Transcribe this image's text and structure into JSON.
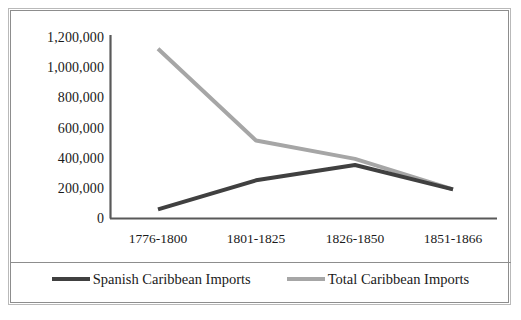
{
  "chart_data": {
    "type": "line",
    "title": "",
    "xlabel": "",
    "ylabel": "",
    "categories": [
      "1776-1800",
      "1801-1825",
      "1826-1850",
      "1851-1866"
    ],
    "ylim": [
      0,
      1200000
    ],
    "yticks": [
      "0",
      "200,000",
      "400,000",
      "600,000",
      "800,000",
      "1,000,000",
      "1,200,000"
    ],
    "ytick_values": [
      0,
      200000,
      400000,
      600000,
      800000,
      1000000,
      1200000
    ],
    "grid": false,
    "legend_position": "bottom",
    "series": [
      {
        "name": "Spanish Caribbean Imports",
        "color": "#404040",
        "values": [
          60000,
          250000,
          350000,
          190000
        ]
      },
      {
        "name": "Total Caribbean Imports",
        "color": "#a6a6a6",
        "values": [
          1110000,
          510000,
          390000,
          190000
        ]
      }
    ]
  },
  "axis": {
    "line_color": "#595959"
  },
  "frame": {
    "outer_color": "#b9b9b9",
    "inner_color": "#8d8d8d"
  }
}
